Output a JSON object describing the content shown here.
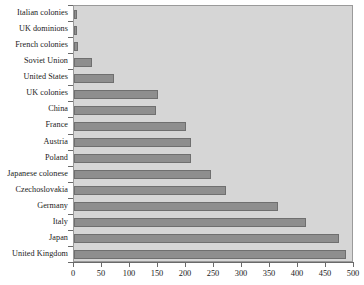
{
  "chart_data": {
    "type": "bar",
    "orientation": "horizontal",
    "title": "",
    "subtitle": "",
    "xlabel": "",
    "ylabel": "",
    "xlim": [
      0,
      500
    ],
    "ylim": null,
    "grid": false,
    "legend": null,
    "legend_position": "none",
    "bar_color": "#8e8e8e",
    "bar_edge_color": "#6f6f6f",
    "plot_background": "#d6d6d6",
    "xticks": [
      0,
      50,
      100,
      150,
      200,
      250,
      300,
      350,
      400,
      450,
      500
    ],
    "xtick_labels": [
      "0",
      "50",
      "100",
      "150",
      "200",
      "250",
      "300",
      "350",
      "400",
      "450",
      "500"
    ],
    "categories": [
      "Italian colonies",
      "UK dominions",
      "French colonies",
      "Soviet Union",
      "United States",
      "UK colonies",
      "China",
      "France",
      "Austria",
      "Poland",
      "Japanese colonese",
      "Czechoslovakia",
      "Germany",
      "Italy",
      "Japan",
      "United Kingdom"
    ],
    "values": [
      5,
      5,
      7,
      33,
      72,
      147,
      150,
      200,
      209,
      209,
      245,
      271,
      364,
      414,
      473,
      486
    ],
    "bars": [
      {
        "label": "Italian colonies",
        "value": 5
      },
      {
        "label": "UK dominions",
        "value": 5
      },
      {
        "label": "French colonies",
        "value": 7
      },
      {
        "label": "Soviet Union",
        "value": 33
      },
      {
        "label": "United States",
        "value": 72
      },
      {
        "label": "UK colonies",
        "value": 150
      },
      {
        "label": "China",
        "value": 147
      },
      {
        "label": "France",
        "value": 200
      },
      {
        "label": "Austria",
        "value": 209
      },
      {
        "label": "Poland",
        "value": 209
      },
      {
        "label": "Japanese colonese",
        "value": 245
      },
      {
        "label": "Czechoslovakia",
        "value": 271
      },
      {
        "label": "Germany",
        "value": 364
      },
      {
        "label": "Italy",
        "value": 414
      },
      {
        "label": "Japan",
        "value": 473
      },
      {
        "label": "United Kingdom",
        "value": 486
      }
    ]
  }
}
